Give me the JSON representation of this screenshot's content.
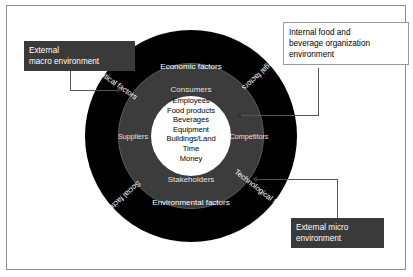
{
  "diagram": {
    "core": {
      "name": "internal-organization-resources",
      "items": [
        "Employees",
        "Food products",
        "Beverages",
        "Equipment",
        "Buildings/Land",
        "Time",
        "Money"
      ]
    },
    "micro_ring": {
      "name": "external-micro-environment",
      "fill": "#3c3c3c",
      "labels": {
        "top": "Consumers",
        "bottom": "Stakeholders",
        "left": "Suppliers",
        "right": "Competitors"
      }
    },
    "macro_ring": {
      "name": "external-macro-environment",
      "fill": "#000000",
      "labels": {
        "top": "Economic factors",
        "bottom": "Environmental factors",
        "upper_left": "Political factors",
        "upper_right": "Legal factors",
        "lower_left": "Social factors",
        "lower_right": "Technological factors"
      }
    }
  },
  "callouts": {
    "macro": {
      "style": "dark",
      "lines": [
        "External",
        "macro environment"
      ]
    },
    "internal": {
      "style": "light",
      "lines": [
        "Internal food and",
        "beverage organization",
        "environment"
      ]
    },
    "micro": {
      "style": "dark",
      "lines": [
        "External micro",
        "environment"
      ]
    }
  },
  "colors": {
    "macro_ring": "#000000",
    "micro_ring": "#3c3c3c",
    "core": "#ffffff",
    "callout_dark_bg": "#3a3a3a",
    "frame_border": "#8d8d8d"
  }
}
